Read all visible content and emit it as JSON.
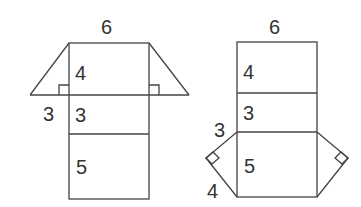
{
  "figures": [
    {
      "name": "net-triangles-on-top-face",
      "labels": {
        "top_width": "6",
        "face1_height": "4",
        "triangle_base": "3",
        "face2_height": "3",
        "face3_height": "5"
      }
    },
    {
      "name": "net-triangles-on-bottom-face",
      "labels": {
        "top_width": "6",
        "face1_height": "4",
        "face2_height": "3",
        "triangle_leg_a": "3",
        "face3_height": "5",
        "triangle_leg_b": "4"
      }
    }
  ],
  "colors": {
    "stroke": "#444444",
    "text": "#333333",
    "background": "#ffffff"
  }
}
